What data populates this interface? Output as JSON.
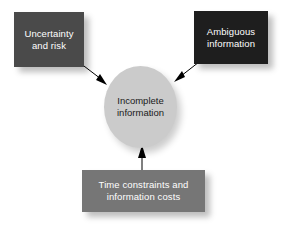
{
  "diagram": {
    "background_color": "#ffffff",
    "center": {
      "id": "incomplete-information",
      "label": "Incomplete\ninformation",
      "shape": "ellipse",
      "fill_color": "#cbcbcb",
      "text_color": "#1a1a1a"
    },
    "nodes": [
      {
        "id": "uncertainty-and-risk",
        "label": "Uncertainty\nand risk",
        "shape": "rectangle",
        "fill_color": "#4a4a4a",
        "text_color": "#ffffff"
      },
      {
        "id": "ambiguous-information",
        "label": "Ambiguous\ninformation",
        "shape": "rectangle",
        "fill_color": "#1e1e1e",
        "text_color": "#ffffff"
      },
      {
        "id": "time-constraints-and-information-costs",
        "label": "Time constraints and\ninformation costs",
        "shape": "rectangle",
        "fill_color": "#767676",
        "text_color": "#ffffff"
      }
    ],
    "arrows": [
      {
        "id": "arrow-uncertainty-to-center",
        "from": "uncertainty-and-risk",
        "to": "incomplete-information",
        "direction": "down-right",
        "color": "#000000"
      },
      {
        "id": "arrow-ambiguous-to-center",
        "from": "ambiguous-information",
        "to": "incomplete-information",
        "direction": "down-left",
        "color": "#000000"
      },
      {
        "id": "arrow-time-costs-to-center",
        "from": "time-constraints-and-information-costs",
        "to": "incomplete-information",
        "direction": "up",
        "color": "#000000"
      }
    ]
  }
}
